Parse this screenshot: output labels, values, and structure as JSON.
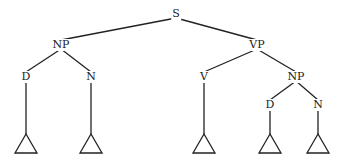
{
  "diagram": {
    "type": "syntax-tree",
    "colors": {
      "line": "#222222",
      "text": "#222222",
      "background": "#ffffff"
    },
    "nodes": [
      {
        "id": "S",
        "label": "S",
        "x": 176,
        "y": 14
      },
      {
        "id": "NP1",
        "label": "NP",
        "x": 61,
        "y": 45
      },
      {
        "id": "VP",
        "label": "VP",
        "x": 257,
        "y": 45
      },
      {
        "id": "D1",
        "label": "D",
        "x": 26,
        "y": 77
      },
      {
        "id": "N1",
        "label": "N",
        "x": 91,
        "y": 77
      },
      {
        "id": "V",
        "label": "V",
        "x": 204,
        "y": 77
      },
      {
        "id": "NP2",
        "label": "NP",
        "x": 296,
        "y": 77
      },
      {
        "id": "D2",
        "label": "D",
        "x": 270,
        "y": 105
      },
      {
        "id": "N2",
        "label": "N",
        "x": 318,
        "y": 105
      }
    ],
    "edges": [
      [
        "S",
        "NP1"
      ],
      [
        "S",
        "VP"
      ],
      [
        "NP1",
        "D1"
      ],
      [
        "NP1",
        "N1"
      ],
      [
        "VP",
        "V"
      ],
      [
        "VP",
        "NP2"
      ],
      [
        "NP2",
        "D2"
      ],
      [
        "NP2",
        "N2"
      ]
    ],
    "leaf_triangles": [
      {
        "parent": "D1",
        "x": 26,
        "apex_y": 134,
        "base_y": 153
      },
      {
        "parent": "N1",
        "x": 91,
        "apex_y": 134,
        "base_y": 153
      },
      {
        "parent": "V",
        "x": 204,
        "apex_y": 134,
        "base_y": 153
      },
      {
        "parent": "D2",
        "x": 270,
        "apex_y": 134,
        "base_y": 153
      },
      {
        "parent": "N2",
        "x": 318,
        "apex_y": 134,
        "base_y": 153
      }
    ]
  }
}
